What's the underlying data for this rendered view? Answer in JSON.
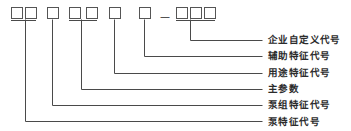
{
  "diagram": {
    "type": "model-designation-callout",
    "colors": {
      "line": "#4a4a4a",
      "box_border": "#555555",
      "box_fill": "#ffffff",
      "text": "#2b2b2b",
      "background": "#ffffff"
    },
    "separator": {
      "glyph": "—",
      "name": "dash-separator"
    },
    "code_boxes": [
      {
        "id": "box-1",
        "group": 1,
        "x": 11,
        "y": 7,
        "w": 11,
        "h": 11,
        "value": ""
      },
      {
        "id": "box-2",
        "group": 1,
        "x": 25,
        "y": 7,
        "w": 11,
        "h": 11,
        "value": ""
      },
      {
        "id": "box-3",
        "group": 2,
        "x": 47,
        "y": 7,
        "w": 11,
        "h": 11,
        "value": ""
      },
      {
        "id": "box-4",
        "group": 3,
        "x": 69,
        "y": 7,
        "w": 11,
        "h": 11,
        "value": ""
      },
      {
        "id": "box-5",
        "group": 3,
        "x": 86,
        "y": 7,
        "w": 11,
        "h": 11,
        "value": ""
      },
      {
        "id": "box-6",
        "group": 4,
        "x": 109,
        "y": 7,
        "w": 11,
        "h": 11,
        "value": ""
      },
      {
        "id": "box-7",
        "group": 5,
        "x": 139,
        "y": 7,
        "w": 11,
        "h": 11,
        "value": ""
      },
      {
        "id": "box-8",
        "group": 6,
        "x": 176,
        "y": 7,
        "w": 11,
        "h": 11,
        "value": ""
      },
      {
        "id": "box-9",
        "group": 6,
        "x": 190,
        "y": 7,
        "w": 11,
        "h": 11,
        "value": ""
      },
      {
        "id": "box-10",
        "group": 6,
        "x": 204,
        "y": 7,
        "w": 11,
        "h": 11,
        "value": ""
      }
    ],
    "callouts": [
      {
        "id": "callout-enterprise-code",
        "label": "企业自定义代号",
        "label_x": 268,
        "label_y": 35,
        "stem_x": 190,
        "stem_top": 20,
        "elbow_y": 40,
        "line_end_x": 262
      },
      {
        "id": "callout-auxiliary-feature-code",
        "label": "辅助特征代号",
        "label_x": 268,
        "label_y": 51,
        "stem_x": 144,
        "stem_top": 20,
        "elbow_y": 56,
        "line_end_x": 262
      },
      {
        "id": "callout-purpose-feature-code",
        "label": "用途特征代号",
        "label_x": 268,
        "label_y": 68,
        "stem_x": 114,
        "stem_top": 20,
        "elbow_y": 73,
        "line_end_x": 262
      },
      {
        "id": "callout-main-parameter",
        "label": "主参数",
        "label_x": 268,
        "label_y": 84,
        "stem_x": 81,
        "stem_top": 20,
        "elbow_y": 89,
        "line_end_x": 262
      },
      {
        "id": "callout-pump-set-feature-code",
        "label": "泵组特征代号",
        "label_x": 268,
        "label_y": 100,
        "stem_x": 52,
        "stem_top": 20,
        "elbow_y": 105,
        "line_end_x": 262
      },
      {
        "id": "callout-pump-feature-code",
        "label": "泵特征代号",
        "label_x": 268,
        "label_y": 117,
        "stem_x": 25,
        "stem_top": 20,
        "elbow_y": 121,
        "line_end_x": 262
      }
    ],
    "group_connectors": [
      {
        "id": "connector-group-1",
        "x1": 11,
        "x2": 36,
        "y": 20
      },
      {
        "id": "connector-group-3",
        "x1": 69,
        "x2": 97,
        "y": 20
      },
      {
        "id": "connector-group-6",
        "x1": 176,
        "x2": 215,
        "y": 20
      }
    ],
    "separator_pos": {
      "x": 160,
      "y": 12
    }
  }
}
